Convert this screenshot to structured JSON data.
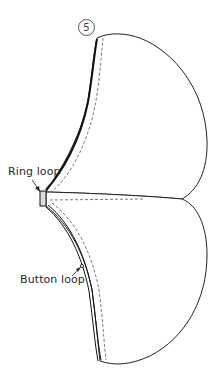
{
  "diagram": {
    "step_number": "5",
    "labels": {
      "ring_loop": "Ring loop",
      "button_loop": "Button loop"
    },
    "colors": {
      "outline": "#222222",
      "stitch": "#555555",
      "background": "#ffffff"
    }
  }
}
